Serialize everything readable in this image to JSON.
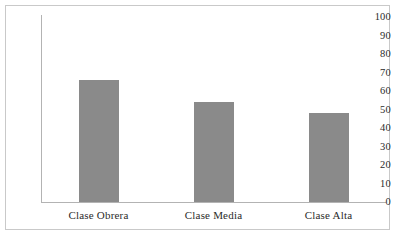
{
  "chart_data": {
    "type": "bar",
    "title": "",
    "subtitle": "",
    "xlabel": "",
    "ylabel": "",
    "categories": [
      "Clase Obrera",
      "Clase Media",
      "Clase Alta"
    ],
    "values": [
      66,
      54,
      48
    ],
    "series": [
      {
        "name": "",
        "values": [
          66,
          54,
          48
        ]
      }
    ],
    "ylim": [
      0,
      100
    ],
    "ytick_labels": [
      "100",
      "90",
      "80",
      "70",
      "60",
      "50",
      "40",
      "30",
      "20",
      "10",
      "0"
    ],
    "ytick_values": [
      100,
      90,
      80,
      70,
      60,
      50,
      40,
      30,
      20,
      10,
      0
    ],
    "grid": false,
    "legend": false,
    "legend_position": "none",
    "annotations": [],
    "colors": {
      "bar_fill": "#8a8a8a",
      "axis_line": "#b3b3b3",
      "frame_border": "#c9c9c9",
      "plot_background": "#ffffff",
      "text": "#2b2b2b"
    }
  }
}
